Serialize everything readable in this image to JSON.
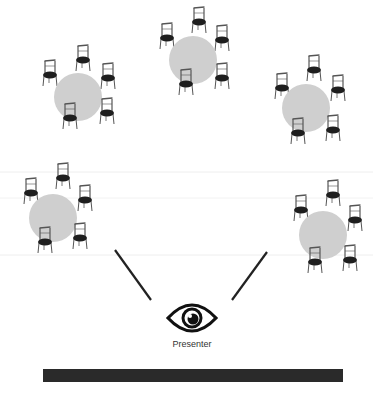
{
  "diagram": {
    "type": "seating-layout",
    "presenter_label": "Presenter",
    "colors": {
      "table": "#cfcfcf",
      "chair": "#1e1e1e",
      "chair_frame": "#555555",
      "line": "#222222",
      "bar": "#2a2a2a",
      "faint_line": "#ececec"
    },
    "tables": [
      {
        "id": "table-1",
        "cx": 78,
        "cy": 97,
        "r": 24,
        "chairs": [
          [
            50,
            75
          ],
          [
            83,
            60
          ],
          [
            108,
            78
          ],
          [
            70,
            118
          ],
          [
            107,
            113
          ]
        ]
      },
      {
        "id": "table-2",
        "cx": 193,
        "cy": 60,
        "r": 24,
        "chairs": [
          [
            167,
            38
          ],
          [
            199,
            22
          ],
          [
            222,
            40
          ],
          [
            186,
            84
          ],
          [
            222,
            78
          ]
        ]
      },
      {
        "id": "table-3",
        "cx": 306,
        "cy": 108,
        "r": 24,
        "chairs": [
          [
            282,
            88
          ],
          [
            314,
            70
          ],
          [
            338,
            90
          ],
          [
            298,
            133
          ],
          [
            333,
            130
          ]
        ]
      },
      {
        "id": "table-4",
        "cx": 53,
        "cy": 218,
        "r": 24,
        "chairs": [
          [
            31,
            193
          ],
          [
            63,
            178
          ],
          [
            85,
            200
          ],
          [
            45,
            242
          ],
          [
            80,
            238
          ]
        ]
      },
      {
        "id": "table-5",
        "cx": 323,
        "cy": 235,
        "r": 24,
        "chairs": [
          [
            301,
            210
          ],
          [
            333,
            195
          ],
          [
            355,
            220
          ],
          [
            315,
            262
          ],
          [
            350,
            260
          ]
        ]
      }
    ],
    "sight_lines": [
      {
        "x1": 115,
        "y1": 250,
        "x2": 151,
        "y2": 300
      },
      {
        "x1": 267,
        "y1": 252,
        "x2": 232,
        "y2": 300
      }
    ],
    "eye": {
      "cx": 192,
      "cy": 318
    },
    "bar": {
      "x": 43,
      "y": 369,
      "w": 300,
      "h": 13
    }
  }
}
